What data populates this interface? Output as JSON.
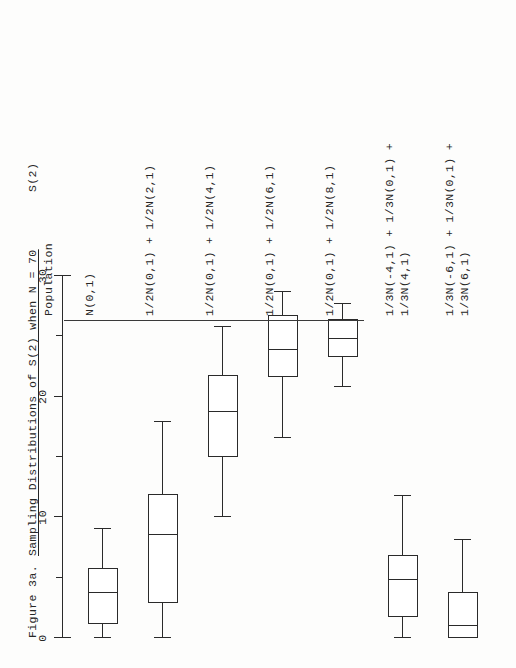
{
  "figure": {
    "number": "Figure 3a.",
    "title": "Sampling Distributions of S(2) when N = 70",
    "axis_name": "S(2)",
    "column_header": "Population"
  },
  "chart_data": {
    "type": "box",
    "title": "Sampling Distributions of S(2) when N = 70",
    "xlabel": "S(2)",
    "ylabel": "Population",
    "orientation": "horizontal",
    "xlim": [
      0,
      30
    ],
    "grid": false,
    "legend": "none",
    "tick_labels": [
      "0",
      "10",
      "20",
      "30"
    ],
    "major_ticks": [
      0,
      10,
      20,
      30
    ],
    "minor_ticks": [
      5,
      15,
      25
    ],
    "categories": [
      "N(0,1)",
      "1/2N(0,1) + 1/2N(2,1)",
      "1/2N(0,1) + 1/2N(4,1)",
      "1/2N(0,1) + 1/2N(6,1)",
      "1/2N(0,1) + 1/2N(8,1)",
      "1/3N(-4,1) + 1/3N(0,1) + 1/3N(4,1)",
      "1/3N(-6,1) + 1/3N(0,1) + 1/3N(6,1)"
    ],
    "boxes": [
      {
        "label": "N(0,1)",
        "whisker_low": 0.0,
        "q1": 1.2,
        "median": 3.7,
        "q3": 5.8,
        "whisker_high": 9.0
      },
      {
        "label": "1/2N(0,1) + 1/2N(2,1)",
        "whisker_low": 0.0,
        "q1": 2.9,
        "median": 8.5,
        "q3": 11.9,
        "whisker_high": 17.9
      },
      {
        "label": "1/2N(0,1) + 1/2N(4,1)",
        "whisker_low": 10.0,
        "q1": 15.0,
        "median": 18.7,
        "q3": 21.8,
        "whisker_high": 25.8
      },
      {
        "label": "1/2N(0,1) + 1/2N(6,1)",
        "whisker_low": 16.6,
        "q1": 21.6,
        "median": 23.9,
        "q3": 26.8,
        "whisker_high": 28.7
      },
      {
        "label": "1/2N(0,1) + 1/2N(8,1)",
        "whisker_low": 20.8,
        "q1": 23.3,
        "median": 24.8,
        "q3": 26.4,
        "whisker_high": 27.7
      },
      {
        "label": "1/3N(-4,1) + 1/3N(0,1) + 1/3N(4,1)",
        "whisker_low": 0.0,
        "q1": 1.7,
        "median": 4.8,
        "q3": 6.9,
        "whisker_high": 11.8
      },
      {
        "label": "1/3N(-6,1) + 1/3N(0,1) + 1/3N(6,1)",
        "whisker_low": 0.0,
        "q1": 0.0,
        "median": 1.0,
        "q3": 3.8,
        "whisker_high": 8.1
      }
    ]
  },
  "axis": {
    "labels": [
      {
        "value": "0",
        "at": 0
      },
      {
        "value": "10",
        "at": 10
      },
      {
        "value": "20",
        "at": 20
      },
      {
        "value": "30",
        "at": 30
      }
    ]
  },
  "populations": [
    {
      "line1": "N(0,1)",
      "line2": ""
    },
    {
      "line1": "1/2N(0,1) + 1/2N(2,1)",
      "line2": ""
    },
    {
      "line1": "1/2N(0,1) + 1/2N(4,1)",
      "line2": ""
    },
    {
      "line1": "1/2N(0,1) + 1/2N(6,1)",
      "line2": ""
    },
    {
      "line1": "1/2N(0,1) + 1/2N(8,1)",
      "line2": ""
    },
    {
      "line1": "1/3N(-4,1) + 1/3N(0,1) +",
      "line2": "1/3N(4,1)"
    },
    {
      "line1": "1/3N(-6,1) + 1/3N(0,1) +",
      "line2": "1/3N(6,1)"
    }
  ],
  "colors": {
    "ink": "#2a2a2a",
    "paper": "#fdfdfc"
  }
}
